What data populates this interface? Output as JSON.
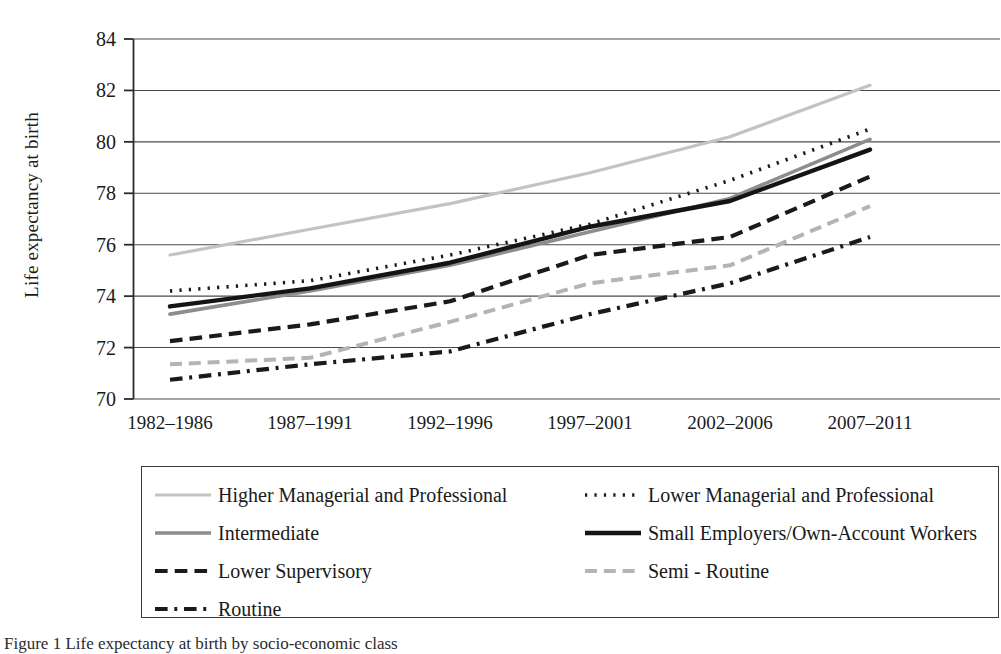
{
  "figure": {
    "caption": "Figure 1   Life expectancy at birth by socio-economic class"
  },
  "axes": {
    "ylabel": "Life expectancy at birth",
    "yticks": [
      "70",
      "72",
      "74",
      "76",
      "78",
      "80",
      "82",
      "84"
    ],
    "xticks": [
      "1982–1986",
      "1987–1991",
      "1992–1996",
      "1997–2001",
      "2002–2006",
      "2007–2011"
    ],
    "ylim": [
      70,
      84
    ],
    "grid": true
  },
  "legend": {
    "position": "below-plot",
    "columns": 2,
    "entries": [
      {
        "label": "Higher Managerial and Professional",
        "style": "solid",
        "color": "#c3c3c3",
        "width": 3.2
      },
      {
        "label": "Lower Managerial and Professional",
        "style": "dotted",
        "color": "#1a1a1a",
        "width": 3.6
      },
      {
        "label": "Intermediate",
        "style": "solid",
        "color": "#8d8d8d",
        "width": 3.6
      },
      {
        "label": "Small Employers/Own-Account Workers",
        "style": "solid",
        "color": "#141414",
        "width": 4.4
      },
      {
        "label": "Lower Supervisory",
        "style": "dashed",
        "color": "#1a1a1a",
        "width": 4.2
      },
      {
        "label": "Semi - Routine",
        "style": "dashed",
        "color": "#b4b4b4",
        "width": 4.0
      },
      {
        "label": "Routine",
        "style": "dashdot",
        "color": "#1a1a1a",
        "width": 4.2
      }
    ]
  },
  "chart_data": {
    "type": "line",
    "title": "",
    "xlabel": "",
    "ylabel": "Life expectancy at birth",
    "ylim": [
      70,
      84
    ],
    "grid": true,
    "legend_position": "below",
    "categories": [
      "1982–1986",
      "1987–1991",
      "1992–1996",
      "1997–2001",
      "2002–2006",
      "2007–2011"
    ],
    "series": [
      {
        "name": "Higher Managerial and Professional",
        "values": [
          75.6,
          76.6,
          77.6,
          78.8,
          80.2,
          82.2
        ]
      },
      {
        "name": "Lower Managerial and Professional",
        "values": [
          74.2,
          74.6,
          75.6,
          76.8,
          78.5,
          80.5
        ]
      },
      {
        "name": "Intermediate",
        "values": [
          73.3,
          74.2,
          75.2,
          76.5,
          77.8,
          80.1
        ]
      },
      {
        "name": "Small Employers/Own-Account Workers",
        "values": [
          73.6,
          74.3,
          75.3,
          76.7,
          77.7,
          79.7
        ]
      },
      {
        "name": "Lower Supervisory",
        "values": [
          72.25,
          72.9,
          73.8,
          75.6,
          76.3,
          78.65
        ]
      },
      {
        "name": "Semi - Routine",
        "values": [
          71.35,
          71.6,
          73.0,
          74.5,
          75.2,
          77.5
        ]
      },
      {
        "name": "Routine",
        "values": [
          70.75,
          71.35,
          71.85,
          73.3,
          74.5,
          76.3
        ]
      }
    ]
  }
}
